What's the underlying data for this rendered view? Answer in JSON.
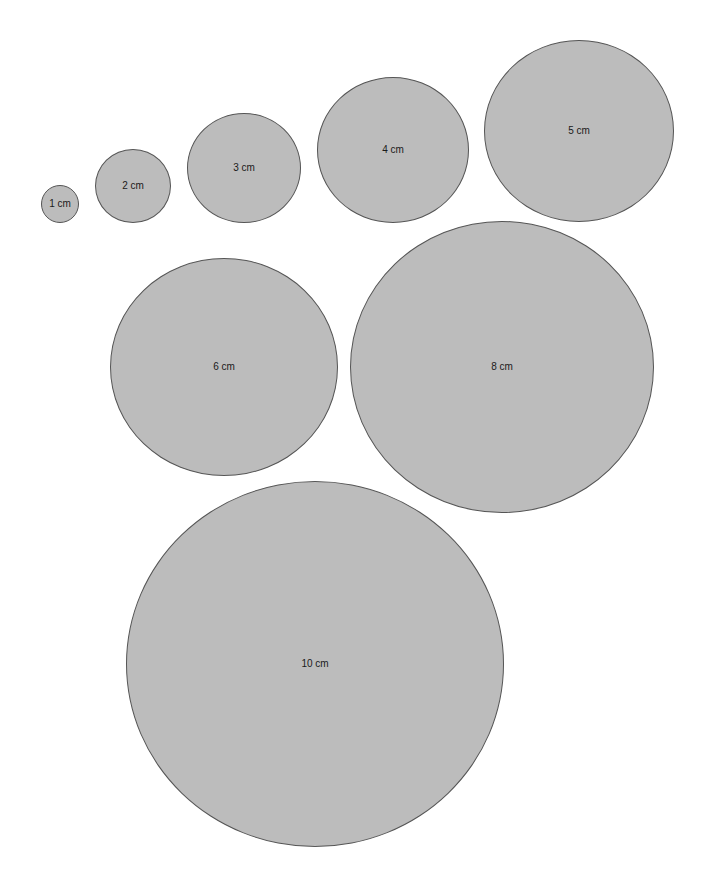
{
  "diagram": {
    "fill_color": "#bcbcbc",
    "stroke_color": "#555555",
    "circles": [
      {
        "label": "1 cm",
        "cx": 60,
        "cy": 204,
        "rx": 19,
        "ry": 19
      },
      {
        "label": "2 cm",
        "cx": 133,
        "cy": 186,
        "rx": 38,
        "ry": 37
      },
      {
        "label": "3 cm",
        "cx": 244,
        "cy": 168,
        "rx": 57,
        "ry": 55
      },
      {
        "label": "4 cm",
        "cx": 393,
        "cy": 150,
        "rx": 76,
        "ry": 73
      },
      {
        "label": "5 cm",
        "cx": 579,
        "cy": 131,
        "rx": 95,
        "ry": 91
      },
      {
        "label": "6 cm",
        "cx": 224,
        "cy": 367,
        "rx": 114,
        "ry": 109
      },
      {
        "label": "8 cm",
        "cx": 502,
        "cy": 367,
        "rx": 152,
        "ry": 146
      },
      {
        "label": "10 cm",
        "cx": 315,
        "cy": 664,
        "rx": 189,
        "ry": 183
      }
    ]
  }
}
